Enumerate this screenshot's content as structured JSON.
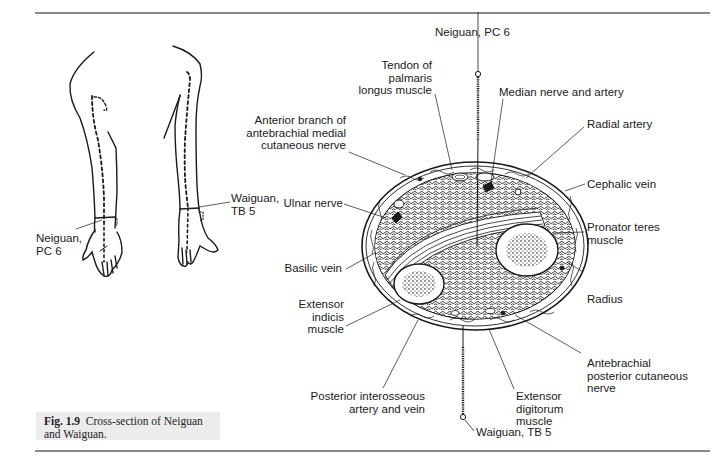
{
  "figure": {
    "number": "Fig. 1.9",
    "caption": "Cross-section of Neiguan and Waiguan.",
    "caption_line1": "Cross-section of Neiguan",
    "caption_line2": "and Waiguan."
  },
  "arms": {
    "left_label": [
      "Neiguan,",
      "PC 6"
    ],
    "right_label": [
      "Waiguan,",
      "TB 5"
    ]
  },
  "cross_section": {
    "needle_top_label": "Neiguan, PC 6",
    "needle_bottom_label": "Waiguan, TB 5",
    "labels_left": [
      {
        "id": "tendon-palmaris",
        "lines": [
          "Tendon of",
          "palmaris",
          "longus muscle"
        ]
      },
      {
        "id": "anterior-branch",
        "lines": [
          "Anterior branch of",
          "antebrachial medial",
          "cutaneous nerve"
        ]
      },
      {
        "id": "ulnar-nerve",
        "lines": [
          "Ulnar nerve"
        ]
      },
      {
        "id": "basilic-vein",
        "lines": [
          "Basilic vein"
        ]
      },
      {
        "id": "extensor-indicis",
        "lines": [
          "Extensor",
          "indicis",
          "muscle"
        ]
      },
      {
        "id": "posterior-interosseous",
        "lines": [
          "Posterior interosseous",
          "artery and vein"
        ]
      }
    ],
    "labels_right": [
      {
        "id": "median-nerve",
        "lines": [
          "Median nerve and artery"
        ]
      },
      {
        "id": "radial-artery",
        "lines": [
          "Radial artery"
        ]
      },
      {
        "id": "cephalic-vein",
        "lines": [
          "Cephalic vein"
        ]
      },
      {
        "id": "pronator-teres",
        "lines": [
          "Pronator teres",
          "muscle"
        ]
      },
      {
        "id": "radius",
        "lines": [
          "Radius"
        ]
      },
      {
        "id": "antebrachial-posterior",
        "lines": [
          "Antebrachial",
          "posterior cutaneous",
          "nerve"
        ]
      },
      {
        "id": "extensor-digitorum",
        "lines": [
          "Extensor",
          "digitorum",
          "muscle"
        ]
      }
    ]
  },
  "colors": {
    "ink": "#1a1a1a",
    "rule": "#8a8a8a",
    "caption_bg": "#ececec"
  }
}
